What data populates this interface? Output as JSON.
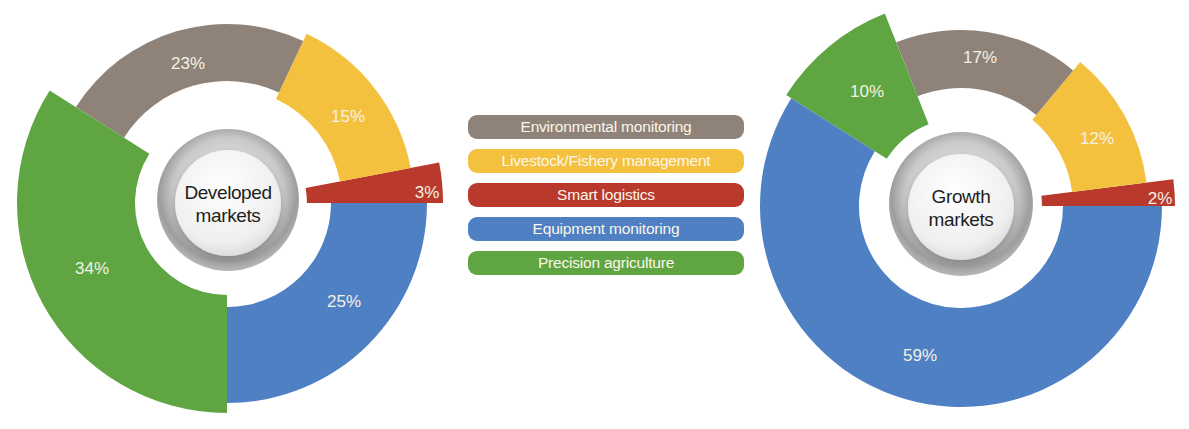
{
  "colors": {
    "environmental": "#8f8379",
    "livestock": "#f4c13f",
    "logistics": "#b93a2c",
    "equipment": "#4f80c4",
    "precision": "#5fa643"
  },
  "legend": [
    {
      "label": "Environmental monitoring",
      "key": "environmental"
    },
    {
      "label": "Livestock/Fishery management",
      "key": "livestock"
    },
    {
      "label": "Smart logistics",
      "key": "logistics"
    },
    {
      "label": "Equipment monitoring",
      "key": "equipment"
    },
    {
      "label": "Precision agriculture",
      "key": "precision"
    }
  ],
  "chart_data": [
    {
      "type": "pie",
      "title": "Developed markets",
      "center_label": [
        "Developed",
        "markets"
      ],
      "center": [
        227,
        203
      ],
      "categories": [
        "Smart logistics",
        "Livestock/Fishery management",
        "Environmental monitoring",
        "Precision agriculture",
        "Equipment monitoring"
      ],
      "values": [
        3,
        15,
        23,
        34,
        25
      ],
      "labels": [
        "3%",
        "15%",
        "23%",
        "34%",
        "25%"
      ],
      "keys": [
        "logistics",
        "livestock",
        "environmental",
        "precision",
        "equipment"
      ],
      "radii": [
        [
          80,
          216
        ],
        [
          115,
          187
        ],
        [
          122,
          179
        ],
        [
          92,
          210
        ],
        [
          104,
          200
        ]
      ],
      "label_pos": [
        [
          427,
          192
        ],
        [
          348,
          116
        ],
        [
          188,
          63
        ],
        [
          92,
          268
        ],
        [
          344,
          301
        ]
      ],
      "start_angle_deg": 0,
      "direction": "counterclockwise"
    },
    {
      "type": "pie",
      "title": "Growth markets",
      "center_label": [
        "Growth",
        "markets"
      ],
      "center": [
        961,
        206
      ],
      "categories": [
        "Smart logistics",
        "Livestock/Fishery management",
        "Environmental monitoring",
        "Precision agriculture",
        "Equipment monitoring"
      ],
      "values": [
        2,
        12,
        17,
        10,
        59
      ],
      "labels": [
        "2%",
        "12%",
        "17%",
        "10%",
        "59%"
      ],
      "keys": [
        "logistics",
        "livestock",
        "environmental",
        "precision",
        "equipment"
      ],
      "radii": [
        [
          81,
          214
        ],
        [
          112,
          187
        ],
        [
          118,
          176
        ],
        [
          88,
          207
        ],
        [
          102,
          201
        ]
      ],
      "label_pos": [
        [
          1160,
          198
        ],
        [
          1097,
          138
        ],
        [
          980,
          57
        ],
        [
          867,
          91
        ],
        [
          920,
          355
        ]
      ],
      "start_angle_deg": 0,
      "direction": "counterclockwise"
    }
  ]
}
